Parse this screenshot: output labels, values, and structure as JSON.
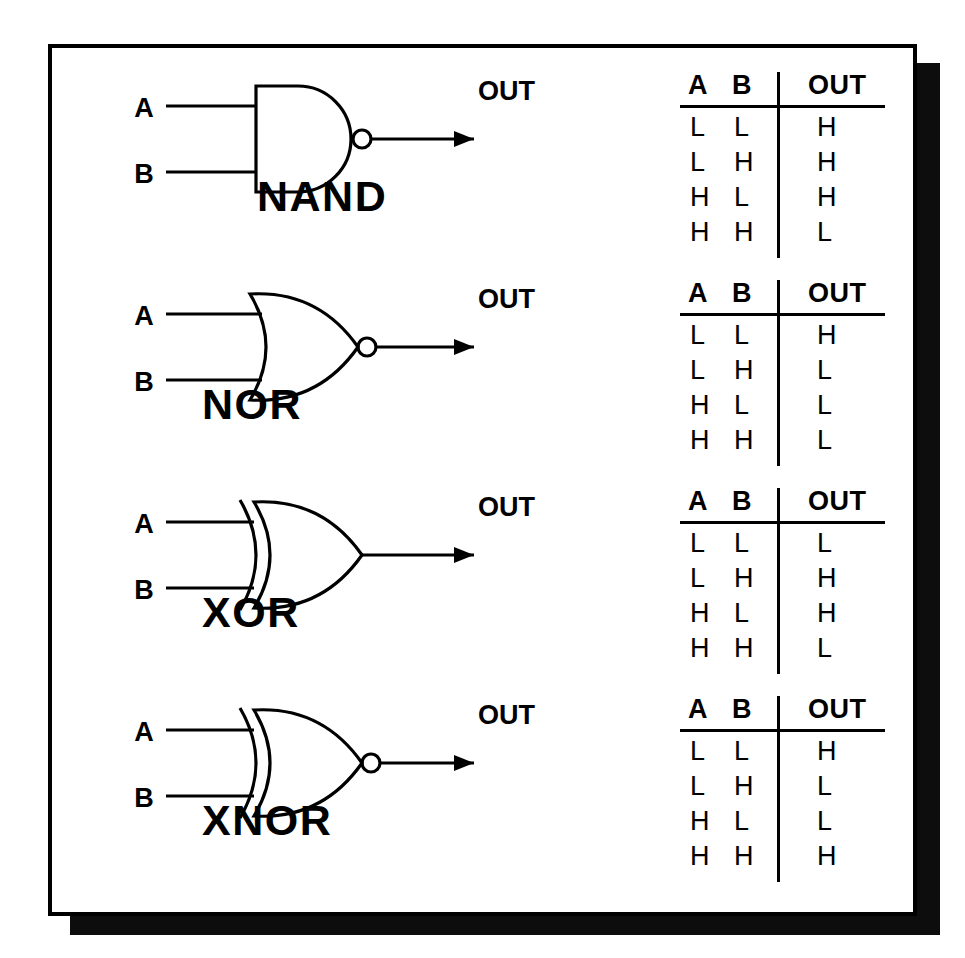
{
  "diagram": {
    "input_labels": [
      "A",
      "B"
    ],
    "output_label": "OUT",
    "table_headers": [
      "A",
      "B",
      "OUT"
    ],
    "levels": {
      "low": "L",
      "high": "H"
    },
    "colors": {
      "ink": "#000000",
      "paper": "#ffffff",
      "shadow": "#0d0d0d"
    }
  },
  "gates": [
    {
      "name": "NAND",
      "label": "NAND",
      "shape": "and",
      "inverted": true,
      "exclusive": false,
      "input_a": "A",
      "input_b": "B",
      "output": "OUT",
      "headers": [
        "A",
        "B",
        "OUT"
      ],
      "rows": [
        {
          "a": "L",
          "b": "L",
          "out": "H"
        },
        {
          "a": "L",
          "b": "H",
          "out": "H"
        },
        {
          "a": "H",
          "b": "L",
          "out": "H"
        },
        {
          "a": "H",
          "b": "H",
          "out": "L"
        }
      ]
    },
    {
      "name": "NOR",
      "label": "NOR",
      "shape": "or",
      "inverted": true,
      "exclusive": false,
      "input_a": "A",
      "input_b": "B",
      "output": "OUT",
      "headers": [
        "A",
        "B",
        "OUT"
      ],
      "rows": [
        {
          "a": "L",
          "b": "L",
          "out": "H"
        },
        {
          "a": "L",
          "b": "H",
          "out": "L"
        },
        {
          "a": "H",
          "b": "L",
          "out": "L"
        },
        {
          "a": "H",
          "b": "H",
          "out": "L"
        }
      ]
    },
    {
      "name": "XOR",
      "label": "XOR",
      "shape": "or",
      "inverted": false,
      "exclusive": true,
      "input_a": "A",
      "input_b": "B",
      "output": "OUT",
      "headers": [
        "A",
        "B",
        "OUT"
      ],
      "rows": [
        {
          "a": "L",
          "b": "L",
          "out": "L"
        },
        {
          "a": "L",
          "b": "H",
          "out": "H"
        },
        {
          "a": "H",
          "b": "L",
          "out": "H"
        },
        {
          "a": "H",
          "b": "H",
          "out": "L"
        }
      ]
    },
    {
      "name": "XNOR",
      "label": "XNOR",
      "shape": "or",
      "inverted": true,
      "exclusive": true,
      "input_a": "A",
      "input_b": "B",
      "output": "OUT",
      "headers": [
        "A",
        "B",
        "OUT"
      ],
      "rows": [
        {
          "a": "L",
          "b": "L",
          "out": "H"
        },
        {
          "a": "L",
          "b": "H",
          "out": "L"
        },
        {
          "a": "H",
          "b": "L",
          "out": "L"
        },
        {
          "a": "H",
          "b": "H",
          "out": "H"
        }
      ]
    }
  ]
}
